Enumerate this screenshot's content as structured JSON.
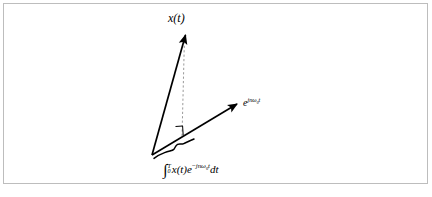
{
  "figure": {
    "type": "vector-projection-diagram",
    "background_color": "#ffffff",
    "border_color": "#bdbdbd",
    "stroke_color": "#000000",
    "dashed_color": "#9a9a9a",
    "labels": {
      "signal_vector": "x(t)",
      "basis_vector_base": "e",
      "basis_vector_exponent_j": "j",
      "basis_vector_exponent_n": "n",
      "basis_vector_exponent_omega": "ω",
      "basis_vector_exponent_sub": "0",
      "basis_vector_exponent_t": "t",
      "integral_lower_limit": "0",
      "integral_upper_limit": "T",
      "integrand_signal": "x(t)",
      "integrand_exp_base": "e",
      "integrand_exp_sign": "−",
      "integrand_exp_j": "j",
      "integrand_exp_n": "n",
      "integrand_exp_omega": "ω",
      "integrand_exp_sub": "0",
      "integrand_exp_t": "t",
      "differential": "dt"
    },
    "geometry": {
      "origin": [
        152,
        155
      ],
      "signal_vector_tip": [
        185,
        33
      ],
      "basis_vector_tip": [
        238,
        103
      ],
      "projection_foot": [
        182,
        136
      ],
      "dashed_top": [
        185,
        36
      ],
      "dashed_bottom": [
        182,
        136
      ],
      "right_angle_marker": [
        176,
        128
      ],
      "brace_start": [
        156,
        152
      ],
      "brace_end": [
        196,
        143
      ]
    }
  }
}
